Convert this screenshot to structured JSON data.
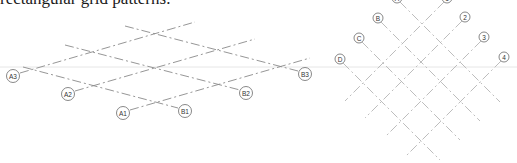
{
  "caption": "rectangular grid patterns.",
  "left_diagram": {
    "description": "skewed grid with A and B series",
    "bubbles": [
      {
        "label": "A3",
        "x": 13,
        "y": 76
      },
      {
        "label": "A2",
        "x": 68,
        "y": 94
      },
      {
        "label": "A1",
        "x": 123,
        "y": 113
      },
      {
        "label": "B1",
        "x": 185,
        "y": 111
      },
      {
        "label": "B2",
        "x": 246,
        "y": 93
      },
      {
        "label": "B3",
        "x": 305,
        "y": 74
      }
    ]
  },
  "right_diagram": {
    "description": "diagonal grid with letter and number series",
    "bubbles": [
      {
        "label": "A",
        "x": 397,
        "y": -2
      },
      {
        "label": "B",
        "x": 378,
        "y": 18
      },
      {
        "label": "C",
        "x": 359,
        "y": 38
      },
      {
        "label": "D",
        "x": 340,
        "y": 59
      },
      {
        "label": "1",
        "x": 447,
        "y": -2
      },
      {
        "label": "2",
        "x": 465,
        "y": 17
      },
      {
        "label": "3",
        "x": 484,
        "y": 37
      },
      {
        "label": "4",
        "x": 504,
        "y": 57
      }
    ]
  },
  "colors": {
    "line": "#8a8a8a",
    "bubble_stroke": "#6a6a6a",
    "background": "#ffffff"
  }
}
